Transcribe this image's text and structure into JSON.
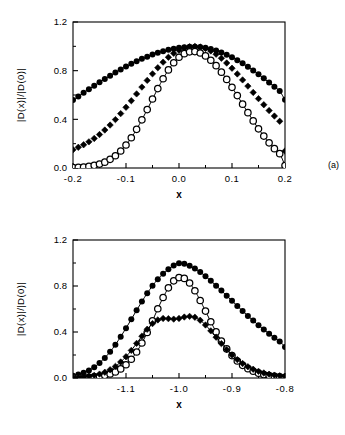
{
  "figure": {
    "background_color": "#ffffff",
    "ink_color": "#000000",
    "width": 345,
    "height": 435
  },
  "panels": [
    {
      "tag": "(a)",
      "xlabel": "x",
      "ylabel": "|D(x)|/|D(0)|"
    },
    {
      "tag": "(b)",
      "xlabel": "x",
      "ylabel": "|D(x)|/|D(0)|"
    }
  ],
  "chart_data": [
    {
      "type": "scatter",
      "title": "",
      "panel": "(a)",
      "xlabel": "x",
      "ylabel": "|D(x)|/|D(0)|",
      "xlim": [
        -0.2,
        0.2
      ],
      "ylim": [
        0.0,
        1.2
      ],
      "xticks": [
        -0.2,
        -0.1,
        0.0,
        0.1,
        0.2
      ],
      "xticklabels": [
        "-0.2",
        "-0.1",
        "0.0",
        "0.1",
        "0.2"
      ],
      "yticks": [
        0.0,
        0.4,
        0.8,
        1.2
      ],
      "yticklabels": [
        "0.0",
        "0.4",
        "0.8",
        "1.2"
      ],
      "minor_xticks": [
        -0.15,
        -0.05,
        0.05,
        0.15
      ],
      "minor_yticks": [
        0.2,
        0.6,
        1.0
      ],
      "grid": false,
      "legend": null,
      "series": [
        {
          "name": "broad",
          "marker": "filled-circle",
          "marker_size": 3.0,
          "fit_line": true,
          "x": [
            -0.2,
            -0.19,
            -0.18,
            -0.17,
            -0.16,
            -0.15,
            -0.14,
            -0.13,
            -0.12,
            -0.11,
            -0.1,
            -0.09,
            -0.08,
            -0.07,
            -0.06,
            -0.05,
            -0.04,
            -0.03,
            -0.02,
            -0.01,
            0.0,
            0.01,
            0.02,
            0.03,
            0.04,
            0.05,
            0.06,
            0.07,
            0.08,
            0.09,
            0.1,
            0.11,
            0.12,
            0.13,
            0.14,
            0.15,
            0.16,
            0.17,
            0.18,
            0.19,
            0.2
          ],
          "y": [
            0.558,
            0.588,
            0.618,
            0.647,
            0.676,
            0.705,
            0.732,
            0.759,
            0.785,
            0.81,
            0.834,
            0.856,
            0.877,
            0.897,
            0.915,
            0.932,
            0.947,
            0.96,
            0.972,
            0.981,
            0.988,
            0.993,
            0.996,
            0.997,
            0.995,
            0.989,
            0.979,
            0.966,
            0.95,
            0.931,
            0.91,
            0.886,
            0.86,
            0.832,
            0.802,
            0.77,
            0.737,
            0.703,
            0.668,
            0.632,
            0.56
          ]
        },
        {
          "name": "medium",
          "marker": "filled-diamond",
          "marker_size": 3.2,
          "fit_line": false,
          "x": [
            -0.2,
            -0.19,
            -0.18,
            -0.17,
            -0.16,
            -0.15,
            -0.14,
            -0.13,
            -0.12,
            -0.11,
            -0.1,
            -0.09,
            -0.08,
            -0.07,
            -0.06,
            -0.05,
            -0.04,
            -0.03,
            -0.02,
            -0.01,
            0.0,
            0.01,
            0.02,
            0.03,
            0.04,
            0.05,
            0.06,
            0.07,
            0.08,
            0.09,
            0.1,
            0.11,
            0.12,
            0.13,
            0.14,
            0.15,
            0.16,
            0.17,
            0.18,
            0.19,
            0.2
          ],
          "y": [
            0.15,
            0.17,
            0.191,
            0.215,
            0.243,
            0.275,
            0.312,
            0.353,
            0.398,
            0.447,
            0.499,
            0.553,
            0.609,
            0.665,
            0.72,
            0.774,
            0.824,
            0.87,
            0.91,
            0.943,
            0.968,
            0.986,
            0.996,
            0.999,
            0.994,
            0.982,
            0.962,
            0.935,
            0.902,
            0.863,
            0.82,
            0.773,
            0.724,
            0.673,
            0.621,
            0.57,
            0.52,
            0.472,
            0.427,
            0.384,
            0.14
          ]
        },
        {
          "name": "narrow",
          "marker": "open-circle",
          "marker_size": 3.2,
          "fit_line": true,
          "x": [
            -0.2,
            -0.19,
            -0.18,
            -0.17,
            -0.16,
            -0.15,
            -0.14,
            -0.13,
            -0.12,
            -0.11,
            -0.1,
            -0.09,
            -0.08,
            -0.07,
            -0.06,
            -0.05,
            -0.04,
            -0.03,
            -0.02,
            -0.01,
            0.0,
            0.01,
            0.02,
            0.03,
            0.04,
            0.05,
            0.06,
            0.07,
            0.08,
            0.09,
            0.1,
            0.11,
            0.12,
            0.13,
            0.14,
            0.15,
            0.16,
            0.17,
            0.18,
            0.19,
            0.2
          ],
          "y": [
            0.003,
            0.005,
            0.008,
            0.013,
            0.021,
            0.032,
            0.048,
            0.071,
            0.101,
            0.14,
            0.189,
            0.249,
            0.318,
            0.396,
            0.48,
            0.567,
            0.653,
            0.734,
            0.806,
            0.865,
            0.91,
            0.94,
            0.955,
            0.957,
            0.945,
            0.921,
            0.886,
            0.841,
            0.788,
            0.728,
            0.663,
            0.595,
            0.525,
            0.455,
            0.387,
            0.322,
            0.262,
            0.207,
            0.159,
            0.118,
            0.02
          ]
        }
      ]
    },
    {
      "type": "scatter",
      "title": "",
      "panel": "(b)",
      "xlabel": "x",
      "ylabel": "|D(x)|/|D(0)|",
      "xlim": [
        -1.2,
        -0.8
      ],
      "ylim": [
        0.0,
        1.2
      ],
      "xticks": [
        -1.1,
        -1.0,
        -0.9,
        -0.8
      ],
      "xticklabels": [
        "-1.1",
        "-1.0",
        "-0.9",
        "-0.8"
      ],
      "yticks": [
        0.0,
        0.4,
        0.8,
        1.2
      ],
      "yticklabels": [
        "0.0",
        "0.4",
        "0.8",
        "1.2"
      ],
      "minor_xticks": [
        -1.15,
        -1.05,
        -0.95,
        -0.85
      ],
      "minor_yticks": [
        0.2,
        0.6,
        1.0
      ],
      "grid": false,
      "legend": null,
      "series": [
        {
          "name": "broad-peak",
          "marker": "filled-circle",
          "marker_size": 3.0,
          "fit_line": true,
          "x": [
            -1.2,
            -1.19,
            -1.18,
            -1.17,
            -1.16,
            -1.15,
            -1.14,
            -1.13,
            -1.12,
            -1.11,
            -1.1,
            -1.09,
            -1.08,
            -1.07,
            -1.06,
            -1.05,
            -1.04,
            -1.03,
            -1.02,
            -1.01,
            -1.0,
            -0.99,
            -0.98,
            -0.97,
            -0.96,
            -0.95,
            -0.94,
            -0.93,
            -0.92,
            -0.91,
            -0.9,
            -0.89,
            -0.88,
            -0.87,
            -0.86,
            -0.85,
            -0.84,
            -0.83,
            -0.82,
            -0.81,
            -0.8
          ],
          "y": [
            0.02,
            0.03,
            0.045,
            0.066,
            0.094,
            0.13,
            0.175,
            0.228,
            0.29,
            0.359,
            0.433,
            0.51,
            0.589,
            0.665,
            0.737,
            0.802,
            0.859,
            0.906,
            0.946,
            0.978,
            0.997,
            0.993,
            0.977,
            0.952,
            0.921,
            0.885,
            0.845,
            0.803,
            0.76,
            0.715,
            0.671,
            0.626,
            0.583,
            0.54,
            0.499,
            0.459,
            0.421,
            0.385,
            0.35,
            0.318,
            0.27
          ]
        },
        {
          "name": "narrow-peak",
          "marker": "open-circle",
          "marker_size": 3.2,
          "fit_line": true,
          "x": [
            -1.2,
            -1.19,
            -1.18,
            -1.17,
            -1.16,
            -1.15,
            -1.14,
            -1.13,
            -1.12,
            -1.11,
            -1.1,
            -1.09,
            -1.08,
            -1.07,
            -1.06,
            -1.05,
            -1.04,
            -1.03,
            -1.02,
            -1.01,
            -1.0,
            -0.99,
            -0.98,
            -0.97,
            -0.96,
            -0.95,
            -0.94,
            -0.93,
            -0.92,
            -0.91,
            -0.9,
            -0.89,
            -0.88,
            -0.87,
            -0.86,
            -0.85,
            -0.84,
            -0.83,
            -0.82,
            -0.81,
            -0.8
          ],
          "y": [
            0.002,
            0.003,
            0.004,
            0.006,
            0.01,
            0.015,
            0.023,
            0.035,
            0.053,
            0.079,
            0.115,
            0.163,
            0.226,
            0.304,
            0.396,
            0.498,
            0.602,
            0.7,
            0.784,
            0.845,
            0.873,
            0.866,
            0.826,
            0.759,
            0.674,
            0.582,
            0.489,
            0.401,
            0.322,
            0.253,
            0.195,
            0.148,
            0.11,
            0.081,
            0.059,
            0.042,
            0.03,
            0.021,
            0.015,
            0.01,
            0.006
          ]
        },
        {
          "name": "low-broad",
          "marker": "filled-diamond",
          "marker_size": 3.2,
          "fit_line": true,
          "x": [
            -1.2,
            -1.19,
            -1.18,
            -1.17,
            -1.16,
            -1.15,
            -1.14,
            -1.13,
            -1.12,
            -1.11,
            -1.1,
            -1.09,
            -1.08,
            -1.07,
            -1.06,
            -1.05,
            -1.04,
            -1.03,
            -1.02,
            -1.01,
            -1.0,
            -0.99,
            -0.98,
            -0.97,
            -0.96,
            -0.95,
            -0.94,
            -0.93,
            -0.92,
            -0.91,
            -0.9,
            -0.89,
            -0.88,
            -0.87,
            -0.86,
            -0.85,
            -0.84,
            -0.83,
            -0.82,
            -0.81,
            -0.8
          ],
          "y": [
            0.004,
            0.006,
            0.01,
            0.015,
            0.023,
            0.034,
            0.05,
            0.072,
            0.101,
            0.139,
            0.185,
            0.24,
            0.301,
            0.364,
            0.424,
            0.473,
            0.505,
            0.518,
            0.516,
            0.512,
            0.518,
            0.53,
            0.536,
            0.528,
            0.502,
            0.461,
            0.41,
            0.355,
            0.299,
            0.247,
            0.2,
            0.16,
            0.126,
            0.098,
            0.076,
            0.058,
            0.044,
            0.033,
            0.025,
            0.019,
            0.014
          ]
        }
      ]
    }
  ]
}
